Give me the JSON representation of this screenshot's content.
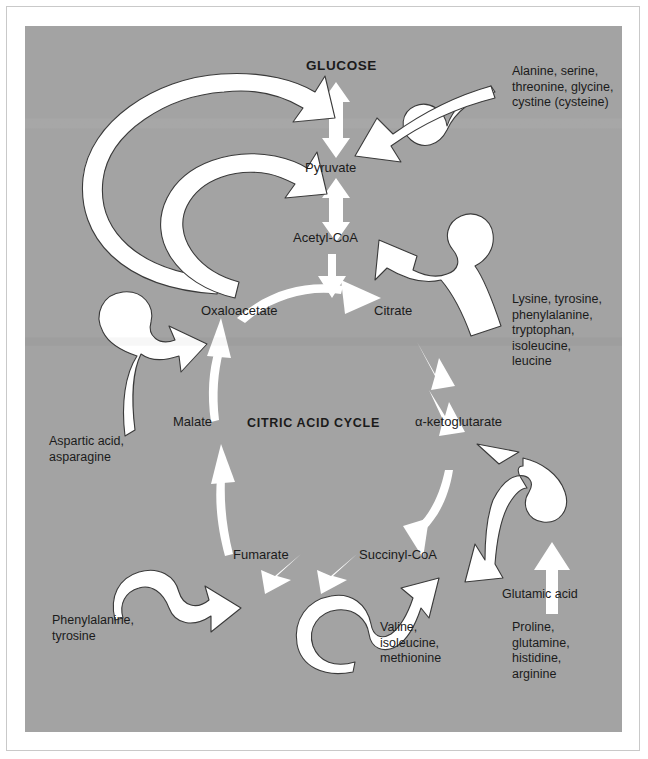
{
  "figure": {
    "panel_color": "#a3a3a3",
    "arrow_color": "#ffffff",
    "text_color": "#1b1b1b"
  },
  "nodes": {
    "glucose": "GLUCOSE",
    "pyruvate": "Pyruvate",
    "acetyl_coa": "Acetyl-CoA",
    "oxaloacetate": "Oxaloacetate",
    "citrate": "Citrate",
    "alpha_ketoglutarate": "α-ketoglutarate",
    "succinyl_coa": "Succinyl-CoA",
    "fumarate": "Fumarate",
    "malate": "Malate",
    "cycle_title": "CITRIC ACID CYCLE"
  },
  "amino_acid_groups": {
    "to_pyruvate": "Alanine, serine,\nthreonine, glycine,\ncystine (cysteine)",
    "to_acetyl_coa": "Lysine, tyrosine,\nphenylalanine,\ntryptophan,\nisoleucine,\nleucine",
    "to_alpha_ketoglutarate": "Glutamic acid",
    "to_glutamic_acid": "Proline,\nglutamine,\nhistidine,\narginine",
    "to_succinyl_coa": "Valine,\nisoleucine,\nmethionine",
    "to_fumarate": "Phenylalanine,\ntyrosine",
    "to_oxaloacetate": "Aspartic acid,\nasparagine"
  },
  "pathway_edges": [
    {
      "from": "Pyruvate",
      "to": "GLUCOSE",
      "style": "double-headed"
    },
    {
      "from": "Pyruvate",
      "to": "Acetyl-CoA",
      "style": "double-headed"
    },
    {
      "from": "Oxaloacetate",
      "to": "GLUCOSE",
      "style": "curved-sweep"
    },
    {
      "from": "Oxaloacetate",
      "to": "Pyruvate",
      "style": "curved-sweep"
    },
    {
      "from": "Oxaloacetate",
      "to": "Citrate",
      "style": "arc"
    },
    {
      "from": "Citrate",
      "to": "α-ketoglutarate",
      "style": "arc"
    },
    {
      "from": "α-ketoglutarate",
      "to": "Succinyl-CoA",
      "style": "arc"
    },
    {
      "from": "Succinyl-CoA",
      "to": "Fumarate",
      "style": "arc"
    },
    {
      "from": "Fumarate",
      "to": "Malate",
      "style": "arc"
    },
    {
      "from": "Malate",
      "to": "Oxaloacetate",
      "style": "arc"
    }
  ]
}
